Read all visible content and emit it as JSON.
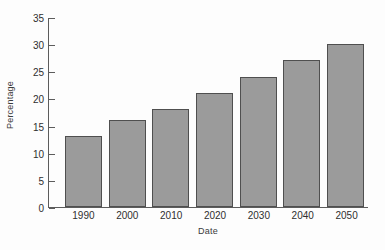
{
  "chart_data": {
    "type": "bar",
    "title": "",
    "xlabel": "Date",
    "ylabel": "Percentage",
    "categories": [
      "1990",
      "2000",
      "2010",
      "2020",
      "2030",
      "2040",
      "2050"
    ],
    "values": [
      13,
      16,
      18,
      21,
      24,
      27,
      30
    ],
    "series": [
      {
        "name": "Percentage",
        "values": [
          13,
          16,
          18,
          21,
          24,
          27,
          30
        ]
      }
    ],
    "ylim": [
      0,
      35
    ],
    "yticks": [
      0,
      5,
      10,
      15,
      20,
      25,
      30,
      35
    ],
    "ytick_labels": [
      "0",
      "5",
      "10",
      "15",
      "20",
      "25",
      "30",
      "35"
    ],
    "grid": false,
    "legend": false,
    "legend_position": "none",
    "bar_color": "#9b9b9b",
    "bar_edge_color": "#4f4f4f",
    "axis_color": "#5c5c5c",
    "background_color": "#fdfdfd",
    "text_color": "#2f2f2f",
    "spines": [
      "left",
      "bottom"
    ],
    "tick_direction": "in"
  }
}
